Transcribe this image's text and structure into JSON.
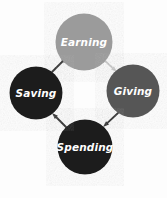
{
  "diagram": {
    "background_color": "#fdfdfd",
    "direction": "clockwise",
    "nodes": [
      {
        "id": "earning",
        "label": "Earning",
        "position": "top",
        "cx": 84,
        "cy": 42,
        "r": 28.5,
        "fill": "#9b9b9b",
        "text_color": "#ffffff",
        "font_size": 10.5
      },
      {
        "id": "giving",
        "label": "Giving",
        "position": "right",
        "cx": 133,
        "cy": 91,
        "r": 26.5,
        "fill": "#565656",
        "text_color": "#ffffff",
        "font_size": 10.5
      },
      {
        "id": "spending",
        "label": "Spending",
        "position": "bottom",
        "cx": 85,
        "cy": 147,
        "r": 27.5,
        "fill": "#1c1c1c",
        "text_color": "#ffffff",
        "font_size": 10.5
      },
      {
        "id": "saving",
        "label": "Saving",
        "position": "left",
        "cx": 36,
        "cy": 93,
        "r": 26.5,
        "fill": "#1c1c1c",
        "text_color": "#ffffff",
        "font_size": 10.5
      }
    ],
    "arrows": [
      {
        "id": "earning-to-giving",
        "from": "earning",
        "to": "giving",
        "color": "#c9c9c9",
        "x1": 102,
        "y1": 58,
        "x2": 117,
        "y2": 72
      },
      {
        "id": "giving-to-spending",
        "from": "giving",
        "to": "spending",
        "color": "#2b2b2b",
        "x1": 118,
        "y1": 113,
        "x2": 103,
        "y2": 127
      },
      {
        "id": "spending-to-saving",
        "from": "spending",
        "to": "saving",
        "color": "#2b2b2b",
        "x1": 67,
        "y1": 128,
        "x2": 52,
        "y2": 113
      },
      {
        "id": "saving-to-earning",
        "from": "saving",
        "to": "earning",
        "color": "#2b2b2b",
        "x1": 52,
        "y1": 72,
        "x2": 67,
        "y2": 57
      }
    ]
  }
}
